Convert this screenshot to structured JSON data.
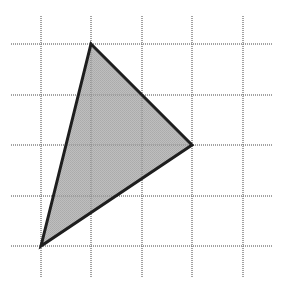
{
  "diagram": {
    "type": "triangle-on-grid",
    "grid": {
      "vertical_lines_x": [
        41,
        91,
        142,
        192,
        243
      ],
      "horizontal_lines_y": [
        44,
        95,
        145,
        196,
        246
      ],
      "x_extent": [
        11,
        272
      ],
      "y_extent": [
        16,
        278
      ],
      "line_color": "#6e6e6e",
      "style": "dotted"
    },
    "triangle": {
      "vertices": [
        {
          "name": "top",
          "x": 91,
          "y": 44,
          "grid": [
            1,
            0
          ]
        },
        {
          "name": "right",
          "x": 192,
          "y": 145,
          "grid": [
            3,
            2
          ]
        },
        {
          "name": "bottom-left",
          "x": 41,
          "y": 246,
          "grid": [
            0,
            4
          ]
        }
      ],
      "fill_color": "#b3b3b3",
      "stroke_color": "#1e1e1e",
      "stroke_width": 3
    }
  }
}
